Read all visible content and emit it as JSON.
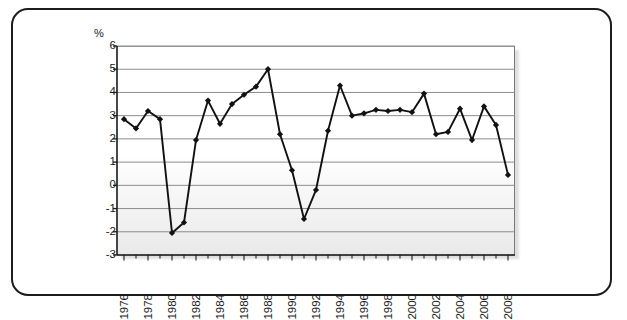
{
  "figure": {
    "unit_label": "%",
    "frame_color": "#1d1d1d",
    "line_color": "#111111",
    "marker_color": "#111111",
    "grid_color": "#8c8c8c",
    "plot_bg_top": "#ffffff",
    "plot_bg_bottom": "#e9e9e9"
  },
  "chart_data": {
    "type": "line",
    "title": "",
    "subtitle": "",
    "xlabel": "",
    "ylabel": "%",
    "ylim": [
      -3,
      6
    ],
    "xlim": [
      1976,
      2008
    ],
    "grid": true,
    "legend": "none",
    "y_ticks": [
      6,
      5,
      4,
      3,
      2,
      1,
      0,
      -1,
      -2,
      -3
    ],
    "y_tick_labels": [
      "6",
      "5",
      "4",
      "3",
      "2",
      "1",
      "0",
      "-1",
      "-2",
      "-3"
    ],
    "x_tick_labels": [
      "1976",
      "1978",
      "1980",
      "1982",
      "1984",
      "1986",
      "1988",
      "1990",
      "1992",
      "1994",
      "1996",
      "1998",
      "2000",
      "2002",
      "2004",
      "2006",
      "2008"
    ],
    "x_tick_step": 2,
    "x_minor_step": 1,
    "marker": "diamond",
    "series": [
      {
        "name": "",
        "x": [
          1976,
          1977,
          1978,
          1979,
          1980,
          1981,
          1982,
          1983,
          1984,
          1985,
          1986,
          1987,
          1988,
          1989,
          1990,
          1991,
          1992,
          1993,
          1994,
          1995,
          1996,
          1997,
          1998,
          1999,
          2000,
          2001,
          2002,
          2003,
          2004,
          2005,
          2006,
          2007,
          2008
        ],
        "values": [
          2.85,
          2.45,
          3.2,
          2.85,
          -2.05,
          -1.6,
          1.95,
          3.65,
          2.65,
          3.5,
          3.9,
          4.25,
          5.0,
          2.2,
          0.65,
          -1.45,
          -0.2,
          2.35,
          4.3,
          3.0,
          3.1,
          3.25,
          3.2,
          3.25,
          3.15,
          3.95,
          2.2,
          2.3,
          3.3,
          1.95,
          3.4,
          2.6,
          0.45
        ]
      }
    ]
  }
}
